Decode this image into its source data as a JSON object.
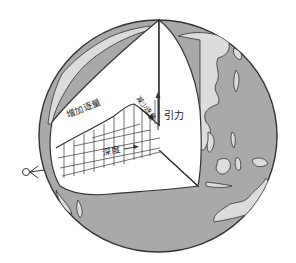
{
  "figure": {
    "colors": {
      "ocean": "#a9a9a9",
      "land": "#dcdcdc",
      "interior": "#ffffff",
      "outline": "#333333",
      "background": "#ffffff"
    },
    "labels": {
      "increase": "增加逐量",
      "decrease": "减少逐量",
      "gravity": "引力",
      "depth": "深度"
    },
    "axes": {
      "x_label": "深度",
      "y_label": "引力"
    },
    "curve_note": "Gravity increases with depth to a peak then decreases toward the center",
    "observer_icon": "eye-icon"
  }
}
